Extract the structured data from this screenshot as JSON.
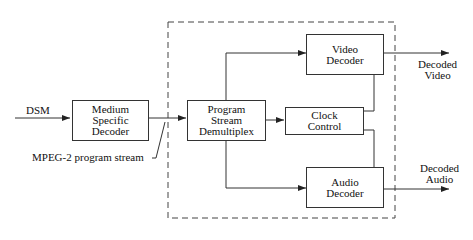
{
  "diagram": {
    "input_label": "DSM",
    "stream_label": "MPEG-2 program stream",
    "blocks": {
      "medium_decoder": [
        "Medium",
        "Specific",
        "Decoder"
      ],
      "demux": [
        "Program",
        "Stream",
        "Demultiplex"
      ],
      "clock": [
        "Clock",
        "Control"
      ],
      "video": [
        "Video",
        "Decoder"
      ],
      "audio": [
        "Audio",
        "Decoder"
      ]
    },
    "outputs": {
      "video": [
        "Decoded",
        "Video"
      ],
      "audio": [
        "Decoded",
        "Audio"
      ]
    },
    "colors": {
      "line": "#333333",
      "background": "#ffffff"
    }
  }
}
